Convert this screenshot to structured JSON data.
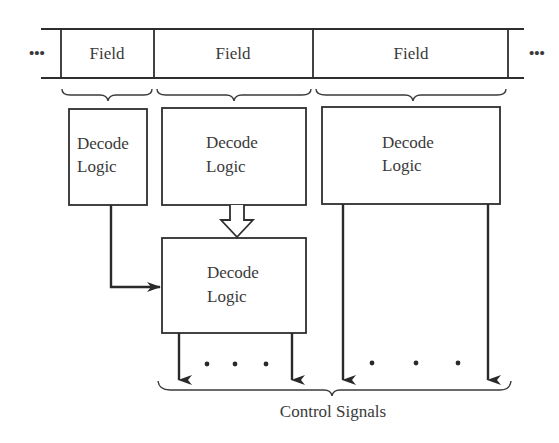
{
  "register": {
    "ellipsis_left": "•••",
    "ellipsis_right": "•••",
    "fields": [
      {
        "label": "Field"
      },
      {
        "label": "Field"
      },
      {
        "label": "Field"
      }
    ]
  },
  "decoders": [
    {
      "line1": "Decode",
      "line2": "Logic"
    },
    {
      "line1": "Decode",
      "line2": "Logic"
    },
    {
      "line1": "Decode",
      "line2": "Logic"
    },
    {
      "line1": "Decode",
      "line2": "Logic"
    }
  ],
  "outputs": {
    "dots_left": "•   •   •",
    "dots_right": "•     •     •",
    "label": "Control Signals"
  },
  "colors": {
    "line": "#2e2e2e",
    "text": "#3a3a3a",
    "background": "#ffffff"
  }
}
